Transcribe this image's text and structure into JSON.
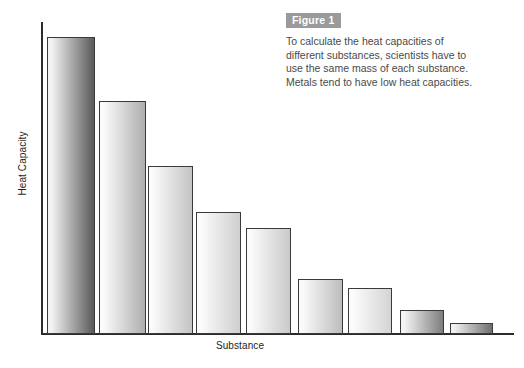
{
  "figure": {
    "badge": "Figure 1",
    "caption_lines": [
      "To calculate the heat capacities of",
      "different substances, scientists have to",
      "use the same mass of each substance.",
      "Metals tend to have low heat capacities."
    ]
  },
  "chart_data": {
    "type": "bar",
    "title": "",
    "xlabel": "Substance",
    "ylabel": "Heat Capacity",
    "grid": false,
    "legend": "none",
    "axis_tick_labels": [],
    "categories": [
      "Helium Gas",
      "Water",
      "Concrete",
      "Ethylene Glycol",
      "Vegetable Oil",
      "Aluminum",
      "Sand",
      "Copper",
      "Lead"
    ],
    "category_label_lines": [
      [
        "Helium Gas"
      ],
      [
        "Water"
      ],
      [
        "Concrete"
      ],
      [
        "Ethylene",
        "Glycol"
      ],
      [
        "Vegetable",
        "Oil"
      ],
      [
        "Aluminum"
      ],
      [
        "Sand"
      ],
      [
        "Copper"
      ],
      [
        "Lead"
      ]
    ],
    "values": [
      100,
      78,
      56,
      41,
      36,
      18,
      15,
      8,
      4
    ],
    "ylim": [
      0,
      105
    ],
    "bars": [
      {
        "name": "Helium Gas",
        "x": 47,
        "width": 48,
        "top": 37,
        "height": 297,
        "fill_start": "#f2f2f2",
        "fill_end": "#5a5a5a"
      },
      {
        "name": "Water",
        "x": 99,
        "width": 47,
        "top": 101,
        "height": 233,
        "fill_start": "#fbfbfb",
        "fill_end": "#aeaeae"
      },
      {
        "name": "Concrete",
        "x": 148,
        "width": 45,
        "top": 166,
        "height": 168,
        "fill_start": "#fbfbfb",
        "fill_end": "#c4c4c4"
      },
      {
        "name": "Ethylene Glycol",
        "x": 196,
        "width": 45,
        "top": 212,
        "height": 122,
        "fill_start": "#fcfcfc",
        "fill_end": "#cfcfcf"
      },
      {
        "name": "Vegetable Oil",
        "x": 246,
        "width": 45,
        "top": 228,
        "height": 106,
        "fill_start": "#fbfbfb",
        "fill_end": "#c9c9c9"
      },
      {
        "name": "Aluminum",
        "x": 298,
        "width": 45,
        "top": 279,
        "height": 55,
        "fill_start": "#fafafa",
        "fill_end": "#bdbdbd"
      },
      {
        "name": "Sand",
        "x": 348,
        "width": 44,
        "top": 288,
        "height": 46,
        "fill_start": "#fcfcfc",
        "fill_end": "#d4d4d4"
      },
      {
        "name": "Copper",
        "x": 400,
        "width": 44,
        "top": 310,
        "height": 24,
        "fill_start": "#f4f4f4",
        "fill_end": "#7d7d7d"
      },
      {
        "name": "Lead",
        "x": 450,
        "width": 43,
        "top": 323,
        "height": 11,
        "fill_start": "#f0f0f0",
        "fill_end": "#6e6e6e"
      }
    ],
    "bar_label_tops": [
      16,
      80,
      146,
      182,
      194,
      258,
      268,
      290,
      303
    ],
    "colors": {
      "axis": "#2b2b2b",
      "bar_outline": "#3a3a3a",
      "text": "#231f20",
      "caption_text": "#4a4a4a",
      "badge_bg": "#9a9a9a",
      "background": "#ffffff"
    }
  }
}
